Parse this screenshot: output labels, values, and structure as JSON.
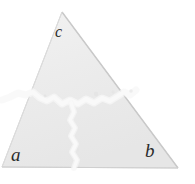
{
  "figure": {
    "kind": "geometry-diagram",
    "background_color": "#ffffff",
    "fill_color": "#ededed",
    "edge_color": "#d2d2d2",
    "crack_color": "#ffffff",
    "label_color": "#2b2b2b",
    "vertices": {
      "apex": {
        "x": 62,
        "y": 12
      },
      "bottom_left": {
        "x": 2,
        "y": 167
      },
      "bottom_right": {
        "x": 178,
        "y": 168
      }
    },
    "labels": [
      {
        "id": "c",
        "text": "c",
        "x": 55,
        "y": 24
      },
      {
        "id": "a",
        "text": "a",
        "x": 11,
        "y": 145
      },
      {
        "id": "b",
        "text": "b",
        "x": 145,
        "y": 141
      }
    ],
    "pieces": [
      {
        "id": "top",
        "label": "c"
      },
      {
        "id": "bottom-left",
        "label": "a"
      },
      {
        "id": "bottom-right",
        "label": "b"
      }
    ]
  }
}
